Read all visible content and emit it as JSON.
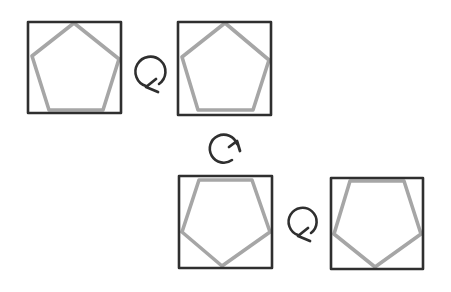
{
  "diagram": {
    "title": "",
    "colors": {
      "background": "#ffffff",
      "square_stroke": "#2f2f2f",
      "pentagon_stroke": "#a6a6a6",
      "arrow_stroke": "#2f2f2f"
    },
    "squares": [
      {
        "id": "square-1",
        "x": 28,
        "y": 22,
        "width": 93,
        "height": 91,
        "pentagon": {
          "orientation": "point-up",
          "points": [
            [
              74,
              23
            ],
            [
              119,
              59
            ],
            [
              103,
              110
            ],
            [
              49,
              110
            ],
            [
              32,
              56
            ]
          ]
        }
      },
      {
        "id": "square-2",
        "x": 178,
        "y": 22,
        "width": 93,
        "height": 93,
        "pentagon": {
          "orientation": "point-up",
          "points": [
            [
              225,
              23
            ],
            [
              269,
              60
            ],
            [
              253,
              110
            ],
            [
              198,
              110
            ],
            [
              182,
              57
            ]
          ]
        }
      },
      {
        "id": "square-3",
        "x": 179,
        "y": 176,
        "width": 93,
        "height": 92,
        "pentagon": {
          "orientation": "point-down",
          "points": [
            [
              199,
              180
            ],
            [
              252,
              180
            ],
            [
              270,
              232
            ],
            [
              222,
              266
            ],
            [
              182,
              232
            ]
          ]
        }
      },
      {
        "id": "square-4",
        "x": 331,
        "y": 178,
        "width": 92,
        "height": 91,
        "pentagon": {
          "orientation": "point-down",
          "points": [
            [
              350,
              181
            ],
            [
              404,
              181
            ],
            [
              421,
              234
            ],
            [
              375,
              267
            ],
            [
              334,
              234
            ]
          ]
        }
      }
    ],
    "arrows": [
      {
        "id": "rotate-arrow-1",
        "direction": "clockwise",
        "cx": 151,
        "cy": 72,
        "r": 15,
        "arc_path": "M 146 86 A 15 15 0 1 1 159 84",
        "head_path": "M 156 79 L 146 87 L 158 92"
      },
      {
        "id": "rotate-arrow-2",
        "direction": "clockwise",
        "cx": 224,
        "cy": 149,
        "r": 14,
        "arc_path": "M 237 144 A 14 14 0 1 0 232 160",
        "head_path": "M 229 147 L 237 141 L 240 151"
      },
      {
        "id": "rotate-arrow-3",
        "direction": "clockwise",
        "cx": 303,
        "cy": 221,
        "r": 14,
        "arc_path": "M 298 235 A 14 14 0 1 1 311 233",
        "head_path": "M 308 228 L 298 236 L 310 241"
      }
    ]
  }
}
